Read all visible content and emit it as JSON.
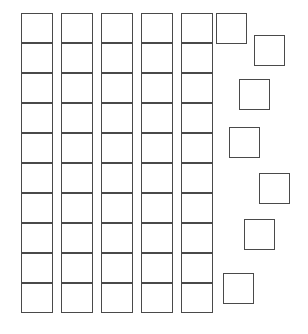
{
  "figure": {
    "title": "Grid of squares with scattered squares",
    "width": 308,
    "height": 334,
    "background_color": "#ffffff",
    "stroke_color": "#4a4a4a",
    "fill_color": "#ffffff"
  },
  "grid": {
    "label": "square-grid",
    "columns": 5,
    "rows": 10,
    "total_cells": 50,
    "cell_width": 32,
    "cell_height": 30,
    "origin_x": 21,
    "origin_y": 13,
    "column_pitch": 40,
    "column_x": [
      21,
      61,
      101,
      141,
      181
    ],
    "row_y": [
      13,
      43,
      73,
      103,
      133,
      163,
      193,
      223,
      253,
      283
    ]
  },
  "scattered": {
    "label": "scattered-squares",
    "count": 7,
    "squares": [
      {
        "name": "scattered-square-1",
        "x": 216,
        "y": 13,
        "size": 31
      },
      {
        "name": "scattered-square-2",
        "x": 254,
        "y": 35,
        "size": 31
      },
      {
        "name": "scattered-square-3",
        "x": 239,
        "y": 79,
        "size": 31
      },
      {
        "name": "scattered-square-4",
        "x": 229,
        "y": 127,
        "size": 31
      },
      {
        "name": "scattered-square-5",
        "x": 259,
        "y": 173,
        "size": 31
      },
      {
        "name": "scattered-square-6",
        "x": 244,
        "y": 219,
        "size": 31
      },
      {
        "name": "scattered-square-7",
        "x": 223,
        "y": 273,
        "size": 31
      }
    ]
  }
}
